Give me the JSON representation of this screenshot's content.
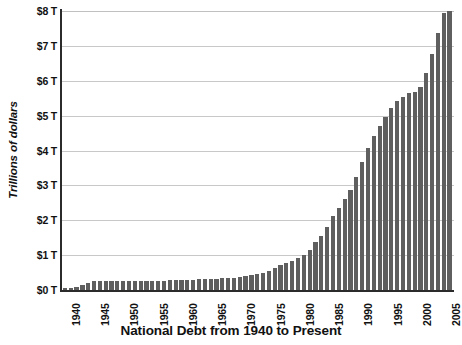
{
  "chart_data": {
    "type": "bar",
    "title": "National Debt from 1940 to Present",
    "xlabel": "",
    "ylabel": "Trillions of dollars",
    "ylim": [
      0,
      8
    ],
    "ytick_labels": [
      "$8 T",
      "$7 T",
      "$6 T",
      "$5 T",
      "$4 T",
      "$3 T",
      "$2 T",
      "$1 T",
      "$0 T"
    ],
    "ytick_values": [
      8,
      7,
      6,
      5,
      4,
      3,
      2,
      1,
      0
    ],
    "yunit_suffix": "T",
    "ycurrency": "$",
    "grid": true,
    "legend": false,
    "bar_color": "#5f5f5f",
    "gridline_color": "#c8c8c8",
    "axis_color": "#2b2b2b",
    "xtick_labels": [
      "1940",
      "1945",
      "1950",
      "1955",
      "1960",
      "1965",
      "1970",
      "1975",
      "1980",
      "1985",
      "1990",
      "1995",
      "2000",
      "2005"
    ],
    "xtick_years": [
      1940,
      1945,
      1950,
      1955,
      1960,
      1965,
      1970,
      1975,
      1980,
      1985,
      1990,
      1995,
      2000,
      2005
    ],
    "categories": [
      1940,
      1941,
      1942,
      1943,
      1944,
      1945,
      1946,
      1947,
      1948,
      1949,
      1950,
      1951,
      1952,
      1953,
      1954,
      1955,
      1956,
      1957,
      1958,
      1959,
      1960,
      1961,
      1962,
      1963,
      1964,
      1965,
      1966,
      1967,
      1968,
      1969,
      1970,
      1971,
      1972,
      1973,
      1974,
      1975,
      1976,
      1977,
      1978,
      1979,
      1980,
      1981,
      1982,
      1983,
      1984,
      1985,
      1986,
      1987,
      1988,
      1989,
      1990,
      1991,
      1992,
      1993,
      1994,
      1995,
      1996,
      1997,
      1998,
      1999,
      2000,
      2001,
      2002,
      2003,
      2004,
      2005,
      2006
    ],
    "values": [
      0.05,
      0.06,
      0.08,
      0.14,
      0.2,
      0.26,
      0.27,
      0.26,
      0.25,
      0.25,
      0.26,
      0.26,
      0.26,
      0.27,
      0.27,
      0.27,
      0.27,
      0.27,
      0.28,
      0.29,
      0.29,
      0.29,
      0.3,
      0.31,
      0.32,
      0.32,
      0.33,
      0.34,
      0.35,
      0.35,
      0.37,
      0.4,
      0.43,
      0.46,
      0.48,
      0.54,
      0.63,
      0.71,
      0.78,
      0.83,
      0.91,
      1.0,
      1.14,
      1.37,
      1.56,
      1.82,
      2.12,
      2.35,
      2.6,
      2.86,
      3.23,
      3.67,
      4.06,
      4.41,
      4.69,
      4.97,
      5.22,
      5.41,
      5.53,
      5.66,
      5.67,
      5.81,
      6.23,
      6.78,
      7.38,
      7.93,
      8.51
    ],
    "n_bars": 67,
    "start_year": 1940,
    "end_year": 2006
  }
}
